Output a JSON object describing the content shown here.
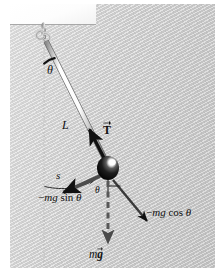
{
  "figure": {
    "panel_color": "#c9c9c9",
    "ceiling_color": "#ffffff",
    "ink_color": "#111111",
    "rod_color": "#f0f0f0",
    "bob_color": "#151515",
    "highlight_color": "#ffffff"
  },
  "labels": {
    "theta_top": "θ",
    "length": "L",
    "tension_symbol": "T",
    "arc_length": "s",
    "theta_bob": "θ",
    "tangential_minus": "−",
    "tangential_mg": "mg",
    "tangential_fn": "sin",
    "tangential_theta": "θ",
    "radial_minus": "−",
    "radial_mg": "mg",
    "radial_fn": "cos",
    "radial_theta": "θ",
    "weight_m": "m",
    "weight_g": "g"
  },
  "annotations": {
    "tangential_force_full": "−mg sin θ",
    "radial_force_full": "−mg cos θ",
    "tension_full": "T (vector)",
    "weight_full": "mg (vector)",
    "rod_length_full": "L",
    "arc_full": "s",
    "angle_at_pivot": "θ",
    "angle_at_bob": "θ"
  },
  "geometry": {
    "pivot": {
      "x": 44,
      "y": 35
    },
    "bob": {
      "x": 108,
      "y": 168
    },
    "bob_radius": 11,
    "vertical_dash_top": {
      "x": 44,
      "y": 40
    },
    "vertical_dash_bottom": {
      "x": 44,
      "y": 268
    },
    "weight_arrow_tip": {
      "x": 108,
      "y": 247
    },
    "tension_arrow_tip": {
      "x": 90,
      "y": 130
    },
    "tangential_arrow_tip": {
      "x": 62,
      "y": 193
    },
    "radial_arrow_tip": {
      "x": 148,
      "y": 222
    }
  }
}
